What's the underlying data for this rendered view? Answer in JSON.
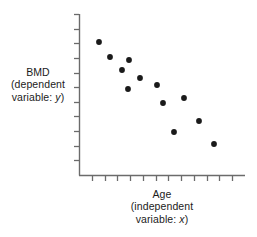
{
  "chart_data": {
    "type": "scatter",
    "title": "",
    "xlabel": "Age (independent variable: x)",
    "ylabel": "BMD (dependent variable: y)",
    "x": [
      99,
      110,
      122,
      128,
      129,
      140,
      157,
      163,
      174,
      184,
      199,
      214
    ],
    "y": [
      42,
      57,
      70,
      89,
      60,
      78,
      85,
      103,
      132,
      98,
      121,
      144
    ],
    "points": [
      {
        "x": 99,
        "y": 42
      },
      {
        "x": 110,
        "y": 57
      },
      {
        "x": 129,
        "y": 60
      },
      {
        "x": 122,
        "y": 70
      },
      {
        "x": 140,
        "y": 78
      },
      {
        "x": 128,
        "y": 89
      },
      {
        "x": 157,
        "y": 85
      },
      {
        "x": 163,
        "y": 103
      },
      {
        "x": 184,
        "y": 98
      },
      {
        "x": 199,
        "y": 121
      },
      {
        "x": 174,
        "y": 132
      },
      {
        "x": 214,
        "y": 144
      }
    ],
    "grid": false,
    "legend": null,
    "xlim": [
      79,
      245
    ],
    "ylim": [
      14,
      175
    ],
    "x_tick_count": 12,
    "y_tick_count": 11,
    "xtick_labels": [],
    "ytick_labels": [],
    "marker_color": "#1a1a1a",
    "axis_color": "#6b6b6b",
    "background": "#ffffff"
  },
  "labels": {
    "y_axis": {
      "line1": "BMD",
      "line2": "(dependent",
      "line3_prefix": "variable: ",
      "line3_var": "y",
      "line3_suffix": ")"
    },
    "x_axis": {
      "line1": "Age",
      "line2": "(independent",
      "line3_prefix": "variable: ",
      "line3_var": "x",
      "line3_suffix": ")"
    }
  }
}
